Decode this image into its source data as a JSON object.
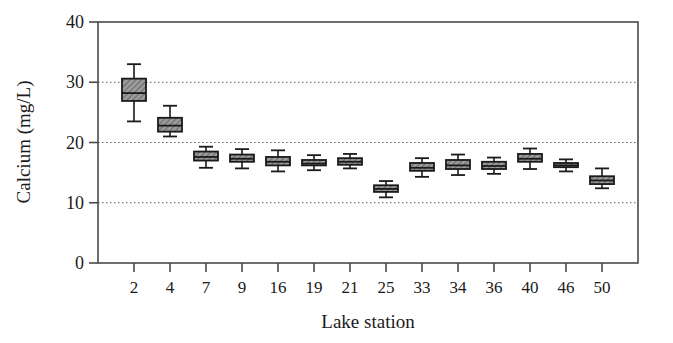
{
  "chart_data": {
    "type": "box",
    "title": "",
    "xlabel": "Lake station",
    "ylabel": "Calcium (mg/L)",
    "categories": [
      "2",
      "4",
      "7",
      "9",
      "16",
      "19",
      "21",
      "25",
      "33",
      "34",
      "36",
      "40",
      "46",
      "50"
    ],
    "ylim": [
      0,
      40
    ],
    "yticks": [
      0,
      10,
      20,
      30,
      40
    ],
    "ytick_labels": [
      "0",
      "10",
      "20",
      "30",
      "40"
    ],
    "grid": "horizontal-dotted-at-10-20-30",
    "legend": "none",
    "box_fill_color": "#9b9b9b",
    "box_edge_color": "#1a1a1a",
    "grid_color": "#5a5a5a",
    "axis_color": "#4a4a4a",
    "boxes": [
      {
        "station": "2",
        "whisker_low": 23.5,
        "q1": 26.9,
        "median": 28.2,
        "q3": 30.6,
        "whisker_high": 33.0
      },
      {
        "station": "4",
        "whisker_low": 21.0,
        "q1": 21.8,
        "median": 22.8,
        "q3": 24.1,
        "whisker_high": 26.1
      },
      {
        "station": "7",
        "whisker_low": 15.8,
        "q1": 17.0,
        "median": 17.6,
        "q3": 18.5,
        "whisker_high": 19.3
      },
      {
        "station": "9",
        "whisker_low": 15.7,
        "q1": 16.8,
        "median": 17.3,
        "q3": 18.0,
        "whisker_high": 18.9
      },
      {
        "station": "16",
        "whisker_low": 15.2,
        "q1": 16.2,
        "median": 16.8,
        "q3": 17.6,
        "whisker_high": 18.7
      },
      {
        "station": "19",
        "whisker_low": 15.4,
        "q1": 16.2,
        "median": 16.5,
        "q3": 17.1,
        "whisker_high": 17.9
      },
      {
        "station": "21",
        "whisker_low": 15.7,
        "q1": 16.3,
        "median": 16.8,
        "q3": 17.4,
        "whisker_high": 18.1
      },
      {
        "station": "25",
        "whisker_low": 10.9,
        "q1": 11.8,
        "median": 12.3,
        "q3": 12.9,
        "whisker_high": 13.6
      },
      {
        "station": "33",
        "whisker_low": 14.3,
        "q1": 15.3,
        "median": 15.8,
        "q3": 16.6,
        "whisker_high": 17.4
      },
      {
        "station": "34",
        "whisker_low": 14.6,
        "q1": 15.6,
        "median": 16.2,
        "q3": 17.1,
        "whisker_high": 18.0
      },
      {
        "station": "36",
        "whisker_low": 14.8,
        "q1": 15.6,
        "median": 16.1,
        "q3": 16.8,
        "whisker_high": 17.5
      },
      {
        "station": "40",
        "whisker_low": 15.6,
        "q1": 16.8,
        "median": 17.3,
        "q3": 18.1,
        "whisker_high": 19.0
      },
      {
        "station": "46",
        "whisker_low": 15.2,
        "q1": 15.9,
        "median": 16.2,
        "q3": 16.6,
        "whisker_high": 17.2
      },
      {
        "station": "50",
        "whisker_low": 12.4,
        "q1": 13.1,
        "median": 13.7,
        "q3": 14.4,
        "whisker_high": 15.7
      }
    ]
  }
}
